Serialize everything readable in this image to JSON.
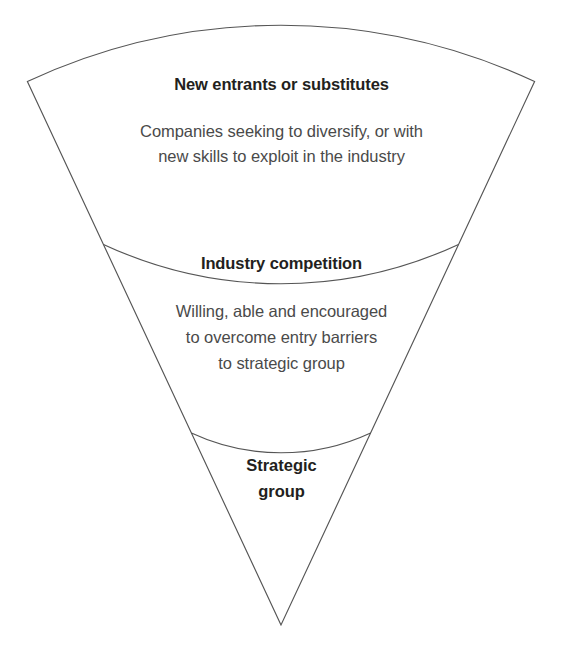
{
  "diagram": {
    "type": "nested-sector-layers",
    "background_color": "#ffffff",
    "stroke_color": "#555555",
    "heading_color": "#231f20",
    "body_color": "#4a4a4a",
    "bands": [
      {
        "id": "outer",
        "heading": "New entrants or substitutes",
        "body_lines": [
          "Companies seeking to diversify, or with",
          "new skills to exploit in the industry"
        ]
      },
      {
        "id": "middle",
        "heading": "Industry competition",
        "body_lines": [
          "Willing, able and encouraged",
          "to overcome entry barriers",
          "to strategic group"
        ]
      },
      {
        "id": "inner",
        "heading_lines": [
          "Strategic",
          "group"
        ],
        "body_lines": []
      }
    ]
  }
}
